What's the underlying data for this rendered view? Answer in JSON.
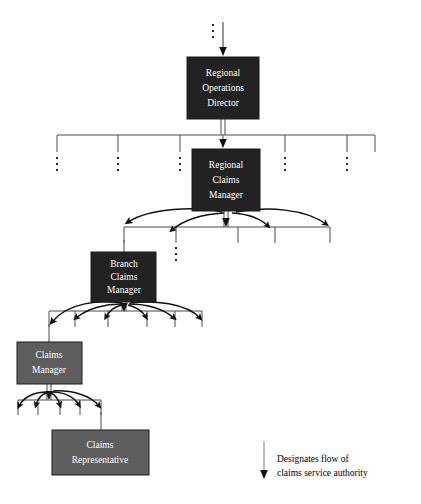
{
  "diagram": {
    "type": "org-chart",
    "background_color": "#ffffff",
    "box_fill_dark": "#222222",
    "box_fill_gray": "#5e5e5e",
    "box_border_color": "#1a1a1a",
    "box_text_color": "#ffffff",
    "line_color": "#4a4a4a",
    "arrow_color": "#111111"
  },
  "nodes": [
    {
      "id": "regional-operations-director",
      "lines": [
        "Regional",
        "Operations",
        "Director"
      ],
      "level": 1,
      "shade": "dark",
      "x": 187,
      "y": 57,
      "w": 72,
      "h": 62
    },
    {
      "id": "regional-claims-manager",
      "lines": [
        "Regional",
        "Claims",
        "Manager"
      ],
      "level": 2,
      "shade": "dark",
      "x": 192,
      "y": 149,
      "w": 68,
      "h": 62
    },
    {
      "id": "branch-claims-manager",
      "lines": [
        "Branch",
        "Claims",
        "Manager"
      ],
      "level": 3,
      "shade": "dark",
      "x": 91,
      "y": 252,
      "w": 65,
      "h": 50
    },
    {
      "id": "claims-manager",
      "lines": [
        "Claims",
        "Manager"
      ],
      "level": 4,
      "shade": "gray",
      "x": 17,
      "y": 342,
      "w": 65,
      "h": 42
    },
    {
      "id": "claims-representative",
      "lines": [
        "Claims",
        "Representative"
      ],
      "level": 5,
      "shade": "gray",
      "x": 52,
      "y": 430,
      "w": 97,
      "h": 45
    }
  ],
  "legend": {
    "arrow_name": "down-arrow",
    "lines": [
      "Designates flow of",
      "claims service authority"
    ],
    "text_x": 277,
    "line1_y": 460,
    "line2_y": 474,
    "arrow_x": 264,
    "arrow_top": 441,
    "arrow_bottom": 479
  },
  "peer_stub_rows": [
    {
      "row": "regional-claims-peers",
      "bar_y": 135,
      "bar_x1": 57,
      "bar_x2": 375,
      "stub_bottom": 152,
      "stubs_x": [
        57,
        118,
        180,
        285,
        347,
        375
      ],
      "ellipsis_x": [
        57,
        118,
        180,
        285,
        347,
        375
      ],
      "ellipsis_y": 158
    },
    {
      "row": "branch-claims-peers",
      "bar_y": 227,
      "bar_x1": 124,
      "bar_x2": 330,
      "stub_bottom": 243,
      "stubs_x": [
        124,
        176,
        238,
        275,
        330
      ],
      "ellipsis_x": [
        176
      ],
      "ellipsis_y": 248
    },
    {
      "row": "claims-manager-peers",
      "bar_y": 311,
      "bar_x1": 49,
      "bar_x2": 202,
      "stub_bottom": 327,
      "stubs_x": [
        49,
        75,
        108,
        147,
        175,
        202
      ],
      "ellipsis_x": [],
      "ellipsis_y": 0
    },
    {
      "row": "claims-rep-peers",
      "bar_y": 400,
      "bar_x1": 18,
      "bar_x2": 101,
      "stub_bottom": 415,
      "stubs_x": [
        18,
        38,
        60,
        80,
        101
      ],
      "ellipsis_x": [],
      "ellipsis_y": 0
    }
  ],
  "top_inflow": {
    "name": "incoming-authority-arrow",
    "line_x": 223,
    "line_top": 22,
    "line_bottom": 56,
    "ellipsis_x": 213,
    "ellipsis_y": 26
  }
}
